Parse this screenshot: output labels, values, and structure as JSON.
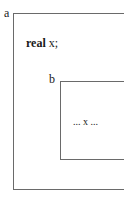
{
  "diagram": {
    "outer_block": {
      "label": "a",
      "declaration": {
        "keyword": "real",
        "identifier": "x;"
      }
    },
    "inner_block": {
      "label": "b",
      "body": "... x ..."
    }
  }
}
